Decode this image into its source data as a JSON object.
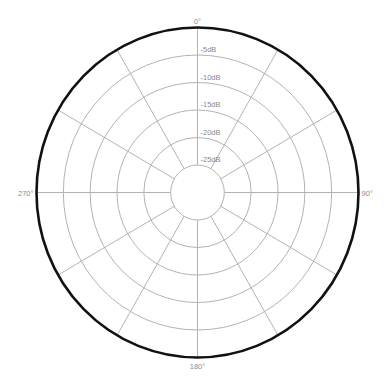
{
  "chart_data": {
    "type": "polar",
    "title": "",
    "angular_axis": {
      "unit": "degrees",
      "direction": "clockwise",
      "zero_at": "top",
      "spoke_step_deg": 30,
      "labels": [
        {
          "angle": 0,
          "text": "0°"
        },
        {
          "angle": 90,
          "text": "90°"
        },
        {
          "angle": 180,
          "text": "180°"
        },
        {
          "angle": 270,
          "text": "270°"
        }
      ]
    },
    "radial_axis": {
      "unit": "dB",
      "range": [
        -30,
        0
      ],
      "ticks": [
        {
          "value": -5,
          "text": "-5dB"
        },
        {
          "value": -10,
          "text": "-10dB"
        },
        {
          "value": -15,
          "text": "-15dB"
        },
        {
          "value": -20,
          "text": "-20dB"
        },
        {
          "value": -25,
          "text": "-25dB"
        }
      ]
    },
    "series": [],
    "grid": true,
    "legend": null
  },
  "style": {
    "outer_ring_color": "#111111",
    "grid_color": "#b3b3b3",
    "label_color": "#8a8a8a"
  }
}
